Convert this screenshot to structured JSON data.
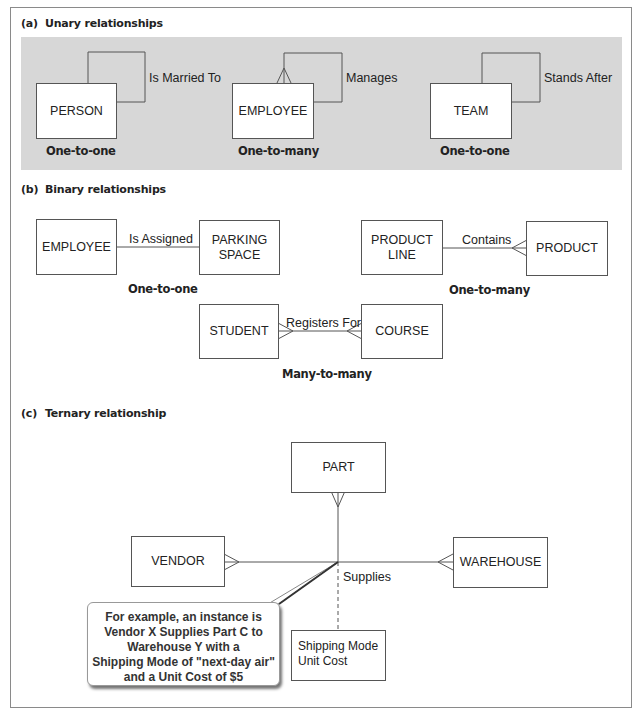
{
  "figure": {
    "sections": {
      "a": {
        "letter": "(a)",
        "title": "Unary relationships",
        "diagrams": [
          {
            "entity": "PERSON",
            "relationship": "Is Married To",
            "cardinality": "One-to-one"
          },
          {
            "entity": "EMPLOYEE",
            "relationship": "Manages",
            "cardinality": "One-to-many"
          },
          {
            "entity": "TEAM",
            "relationship": "Stands After",
            "cardinality": "One-to-one"
          }
        ]
      },
      "b": {
        "letter": "(b)",
        "title": "Binary relationships",
        "diagrams": [
          {
            "entity1": "EMPLOYEE",
            "entity2_line1": "PARKING",
            "entity2_line2": "SPACE",
            "relationship": "Is Assigned",
            "cardinality": "One-to-one"
          },
          {
            "entity1_line1": "PRODUCT",
            "entity1_line2": "LINE",
            "entity2": "PRODUCT",
            "relationship": "Contains",
            "cardinality": "One-to-many"
          },
          {
            "entity1": "STUDENT",
            "entity2": "COURSE",
            "relationship": "Registers For",
            "cardinality": "Many-to-many"
          }
        ]
      },
      "c": {
        "letter": "(c)",
        "title": "Ternary relationship",
        "entities": {
          "top": "PART",
          "left": "VENDOR",
          "right": "WAREHOUSE"
        },
        "relationship": "Supplies",
        "attributes": [
          "Shipping Mode",
          "Unit Cost"
        ],
        "callout_lines": [
          "For example, an instance is",
          "Vendor X Supplies Part C to",
          "Warehouse Y with a",
          "Shipping Mode of \"next-day air\"",
          "and a Unit Cost of $5"
        ]
      }
    },
    "colors": {
      "panel_bg": "#d7d7d7",
      "frame_border": "#8a8a8a",
      "line": "#555555"
    }
  }
}
